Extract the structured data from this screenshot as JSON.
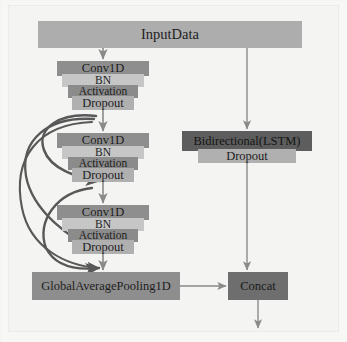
{
  "diagram": {
    "type": "neural-network-architecture",
    "colors": {
      "background": "#f4f4f2",
      "input_block": "#adadad",
      "conv_block": "#8e8e8e",
      "bn_block": "#c6c6c6",
      "activation_block": "#8b8b8b",
      "dropout_block": "#b0b0b0",
      "lstm_block": "#5d5d5d",
      "pooling_block": "#8e8e8e",
      "concat_block": "#6e6e6e",
      "arrow": "#8a8a8a",
      "skip_arrow": "#585858"
    },
    "nodes": {
      "input": {
        "label": "InputData",
        "x": 38,
        "y": 21,
        "w": 264,
        "h": 27
      },
      "conv_block_1": {
        "conv": {
          "label": "Conv1D",
          "x": 57,
          "y": 61,
          "w": 92,
          "h": 15
        },
        "bn": {
          "label": "BN",
          "x": 62,
          "y": 74,
          "w": 82,
          "h": 13
        },
        "activation": {
          "label": "Activation",
          "x": 68,
          "y": 85,
          "w": 70,
          "h": 13
        },
        "dropout": {
          "label": "Dropout",
          "x": 72,
          "y": 96,
          "w": 62,
          "h": 14
        }
      },
      "conv_block_2": {
        "conv": {
          "label": "Conv1D",
          "x": 57,
          "y": 133,
          "w": 92,
          "h": 15
        },
        "bn": {
          "label": "BN",
          "x": 62,
          "y": 146,
          "w": 82,
          "h": 13
        },
        "activation": {
          "label": "Activation",
          "x": 68,
          "y": 157,
          "w": 70,
          "h": 13
        },
        "dropout": {
          "label": "Dropout",
          "x": 72,
          "y": 168,
          "w": 62,
          "h": 14
        }
      },
      "conv_block_3": {
        "conv": {
          "label": "Conv1D",
          "x": 57,
          "y": 205,
          "w": 92,
          "h": 15
        },
        "bn": {
          "label": "BN",
          "x": 62,
          "y": 218,
          "w": 82,
          "h": 13
        },
        "activation": {
          "label": "Activation",
          "x": 68,
          "y": 229,
          "w": 70,
          "h": 13
        },
        "dropout": {
          "label": "Dropout",
          "x": 72,
          "y": 240,
          "w": 62,
          "h": 14
        }
      },
      "bilstm": {
        "label": "Bidirectional(LSTM)",
        "x": 182,
        "y": 131,
        "w": 130,
        "h": 20
      },
      "bilstm_dropout": {
        "label": "Dropout",
        "x": 198,
        "y": 149,
        "w": 98,
        "h": 14
      },
      "global_average_pooling": {
        "label": "GlobalAveragePooling1D",
        "x": 32,
        "y": 272,
        "w": 148,
        "h": 28
      },
      "concat": {
        "label": "Concat",
        "x": 228,
        "y": 272,
        "w": 60,
        "h": 28
      }
    },
    "edges": [
      {
        "from": "input",
        "to": "conv_block_1",
        "kind": "straight"
      },
      {
        "from": "input",
        "to": "bilstm",
        "kind": "straight"
      },
      {
        "from": "conv_block_1",
        "to": "conv_block_2",
        "kind": "straight"
      },
      {
        "from": "conv_block_2",
        "to": "conv_block_3",
        "kind": "straight"
      },
      {
        "from": "conv_block_3",
        "to": "global_average_pooling",
        "kind": "straight"
      },
      {
        "from": "bilstm_dropout",
        "to": "concat",
        "kind": "straight"
      },
      {
        "from": "global_average_pooling",
        "to": "concat",
        "kind": "straight"
      },
      {
        "from": "concat",
        "to": "output",
        "kind": "straight"
      },
      {
        "from": "conv_block_1",
        "to": "conv_block_2",
        "kind": "skip-curve"
      },
      {
        "from": "conv_block_1",
        "to": "conv_block_3",
        "kind": "skip-curve"
      },
      {
        "from": "conv_block_1",
        "to": "global_average_pooling",
        "kind": "skip-curve"
      },
      {
        "from": "conv_block_2",
        "to": "global_average_pooling",
        "kind": "skip-curve"
      }
    ]
  }
}
